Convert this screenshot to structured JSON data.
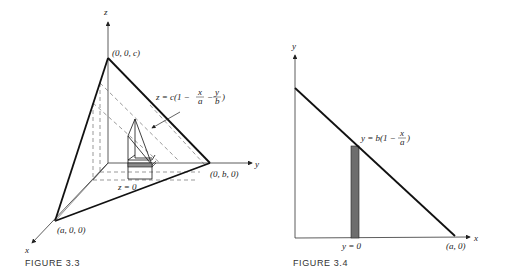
{
  "figure_3_3": {
    "caption": "FIGURE 3.3",
    "axis_labels": {
      "x": "x",
      "y": "y",
      "z": "z"
    },
    "vertex_labels": {
      "apex": "(0, 0, c)",
      "y_intercept": "(0, b, 0)",
      "x_intercept": "(a, 0, 0)"
    },
    "plane_equation": {
      "prefix": "z = c(1 −",
      "frac1_num": "x",
      "frac1_den": "a",
      "minus": "−",
      "frac2_num": "y",
      "frac2_den": "b",
      "suffix": ")"
    },
    "base_label": "z = 0"
  },
  "figure_3_4": {
    "caption": "FIGURE 3.4",
    "axis_labels": {
      "x": "x",
      "y": "y"
    },
    "line_equation": {
      "prefix": "y = b(1 −",
      "frac_num": "x",
      "frac_den": "a",
      "suffix": ")"
    },
    "x_intercept_label": "(a, 0)",
    "strip_label": "y = 0",
    "strip_color": "#6e6e6e"
  }
}
